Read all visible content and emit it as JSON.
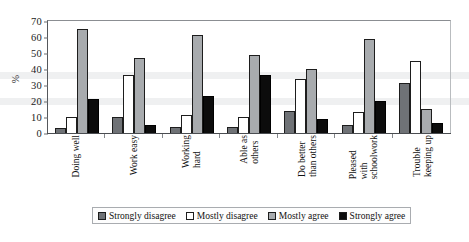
{
  "chart_data": {
    "type": "bar",
    "title": "",
    "xlabel": "",
    "ylabel": "%",
    "ylim": [
      0,
      70
    ],
    "yticks": [
      70,
      60,
      50,
      40,
      30,
      20,
      10,
      0
    ],
    "grid": false,
    "legend_position": "bottom",
    "categories": [
      "Doing well",
      "Work easy",
      "Working hard",
      "Able as others",
      "Do better than others",
      "Pleased with schoolwork",
      "Trouble keeping up"
    ],
    "category_lines": [
      [
        "Doing well"
      ],
      [
        "Work easy"
      ],
      [
        "Working",
        "hard"
      ],
      [
        "Able as",
        "others"
      ],
      [
        "Do better",
        "than others"
      ],
      [
        "Pleased",
        "with",
        "schoolwork"
      ],
      [
        "Trouble",
        "keeping up"
      ]
    ],
    "series": [
      {
        "name": "Strongly disagree",
        "color": "#6f7276",
        "values": [
          3,
          10,
          4,
          4,
          14,
          5,
          31
        ]
      },
      {
        "name": "Mostly disagree",
        "color": "#ffffff",
        "values": [
          10,
          36,
          11,
          10,
          34,
          13,
          45
        ]
      },
      {
        "name": "Mostly agree",
        "color": "#a8abae",
        "values": [
          65,
          47,
          61,
          49,
          40,
          59,
          15
        ]
      },
      {
        "name": "Strongly agree",
        "color": "#0c0c0c",
        "values": [
          21,
          5,
          23,
          36,
          9,
          20,
          6
        ]
      }
    ]
  }
}
